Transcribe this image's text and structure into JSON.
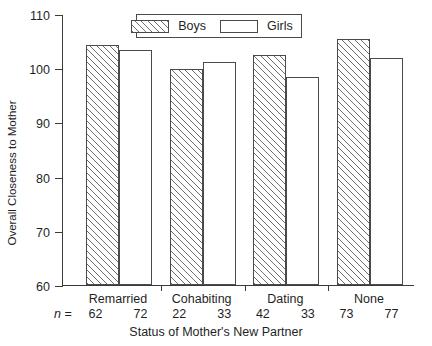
{
  "chart_data": {
    "type": "bar",
    "title": "",
    "xlabel": "Status of Mother's New Partner",
    "ylabel": "Overall Closeness to Mother",
    "categories": [
      "Remarried",
      "Cohabiting",
      "Dating",
      "None"
    ],
    "ylim": [
      60,
      110
    ],
    "yticks": [
      60,
      70,
      80,
      90,
      100,
      110
    ],
    "ytick_labels": [
      "60",
      "70",
      "80",
      "90",
      "100",
      "110"
    ],
    "grid": false,
    "legend_position": "top-center",
    "series": [
      {
        "name": "Boys",
        "values": [
          104.2,
          99.8,
          102.5,
          105.4
        ],
        "n": [
          62,
          22,
          42,
          73
        ],
        "fill": "diagonal-hatch"
      },
      {
        "name": "Girls",
        "values": [
          103.3,
          101.1,
          98.3,
          101.8
        ],
        "n": [
          72,
          33,
          33,
          77
        ],
        "fill": "white"
      }
    ],
    "n_prefix": "n =",
    "n_prefix_italic_part": "n",
    "n_prefix_eq_part": "="
  },
  "legend": {
    "entries": [
      {
        "label": "Boys",
        "swatch": "hatched-rect"
      },
      {
        "label": "Girls",
        "swatch": "empty-rect"
      }
    ]
  },
  "colors": {
    "axis": "#3b3b3b",
    "bar_border": "#4a4a4a",
    "hatch": "#6d6d6d",
    "text": "#1f1f1f",
    "background": "#ffffff"
  }
}
